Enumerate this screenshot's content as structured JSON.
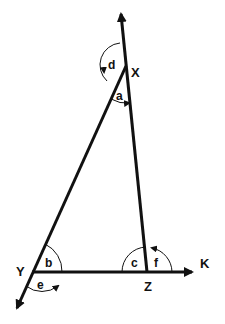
{
  "diagram": {
    "type": "triangle-exterior-angles",
    "colors": {
      "line": "#111111",
      "background": "#ffffff"
    },
    "vertices": {
      "X": {
        "label": "X"
      },
      "Y": {
        "label": "Y"
      },
      "Z": {
        "label": "Z"
      },
      "K": {
        "label": "K"
      }
    },
    "angles": {
      "a": {
        "label": "a",
        "at": "X",
        "kind": "interior"
      },
      "b": {
        "label": "b",
        "at": "Y",
        "kind": "interior"
      },
      "c": {
        "label": "c",
        "at": "Z",
        "kind": "interior"
      },
      "d": {
        "label": "d",
        "at": "X",
        "kind": "exterior"
      },
      "e": {
        "label": "e",
        "at": "Y",
        "kind": "exterior"
      },
      "f": {
        "label": "f",
        "at": "Z",
        "kind": "exterior"
      }
    }
  }
}
